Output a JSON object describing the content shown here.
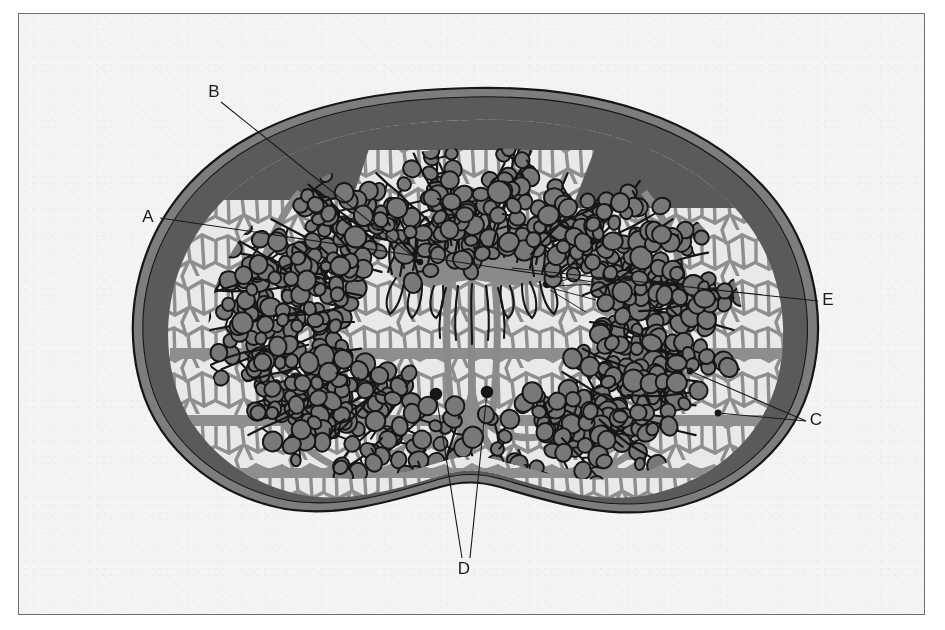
{
  "figure": {
    "kind": "anatomical-cross-section-diagram",
    "style": "grayscale-line-illustration",
    "frame": {
      "x": 18,
      "y": 13,
      "width": 907,
      "height": 602,
      "border_color": "#6f6f6f"
    },
    "background_color": "#f4f4f2"
  },
  "palette": {
    "paper": "#f4f4f2",
    "capsule_dark": "#5a5a5a",
    "capsule_rim": "#7d7d7d",
    "outline_black": "#161616",
    "stroma_light": "#e9e9e7",
    "stroma_strand": "#8e8e8e",
    "acini_fill": "#787878",
    "duct_gray": "#8a8a8a",
    "label_text": "#1a1a1a"
  },
  "labels": [
    {
      "id": "A",
      "text": "A",
      "x": 148,
      "y": 218,
      "leader": {
        "points": "160,218 600,283"
      },
      "anchor": {
        "x": 600,
        "y": 283
      }
    },
    {
      "id": "B",
      "text": "B",
      "x": 214,
      "y": 93,
      "leader": {
        "points": "221,102 420,262"
      },
      "anchor": {
        "x": 420,
        "y": 262
      }
    },
    {
      "id": "C",
      "text": "C",
      "x": 816,
      "y": 421,
      "leader": {
        "points": "806,421 690,371"
      },
      "leader2": {
        "points": "806,421 718,413"
      },
      "anchor": {
        "x": 690,
        "y": 371
      }
    },
    {
      "id": "D",
      "text": "D",
      "x": 464,
      "y": 570,
      "leader": {
        "points": "462,558 436,394"
      },
      "leader2": {
        "points": "470,558 487,392"
      },
      "anchor": {
        "x": 436,
        "y": 394
      }
    },
    {
      "id": "E",
      "text": "E",
      "x": 828,
      "y": 301,
      "leader": {
        "points": "818,301 512,268"
      },
      "anchor": {
        "x": 512,
        "y": 268
      }
    }
  ],
  "regions": [
    {
      "name": "outer-capsule",
      "description": "dark gray fibrous capsule ring surrounding the whole organ"
    },
    {
      "name": "glandular-parenchyma",
      "description": "light field filled with branching ducts and rounded acini"
    },
    {
      "name": "central-duct-system",
      "description": "paired looping ducts converging at the midline crest"
    },
    {
      "name": "midline-crest",
      "description": "frilled crest structure at top centre of the lumen"
    },
    {
      "name": "stroma-network",
      "description": "reticular gray connective-tissue strands between acini"
    },
    {
      "name": "basal-notch",
      "description": "indentation at the bottom midline of the organ outline"
    }
  ]
}
